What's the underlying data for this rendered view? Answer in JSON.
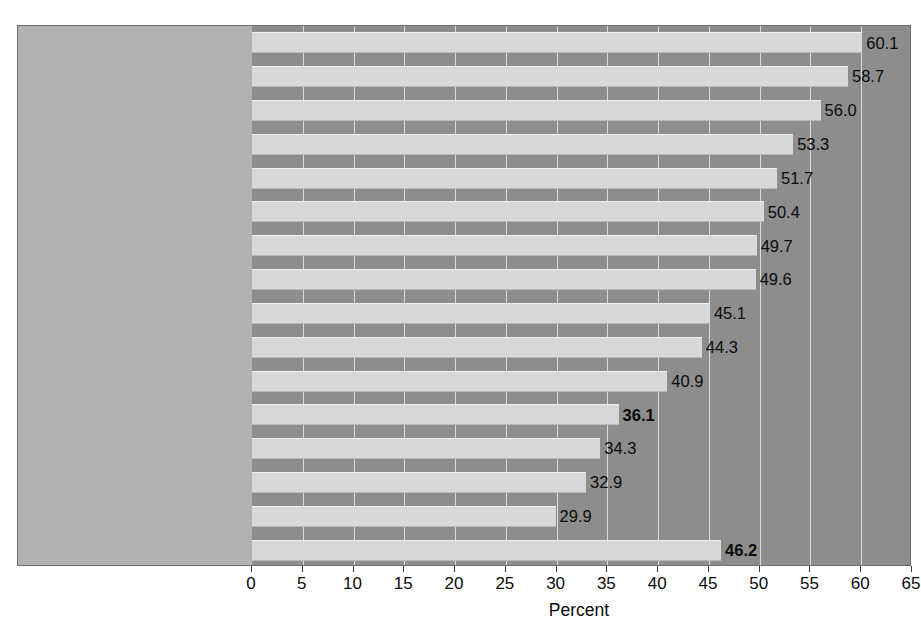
{
  "chart_data": {
    "type": "bar",
    "orientation": "horizontal",
    "title": "",
    "subtitle": "",
    "xlabel": "Percent",
    "ylabel": "",
    "xlim": [
      0,
      65
    ],
    "xticks": [
      0,
      5,
      10,
      15,
      20,
      25,
      30,
      35,
      40,
      45,
      50,
      55,
      60,
      65
    ],
    "xtick_labels": [
      "0",
      "5",
      "10",
      "15",
      "20",
      "25",
      "30",
      "35",
      "40",
      "45",
      "50",
      "55",
      "60",
      "65"
    ],
    "grid": true,
    "grid_axis": "x",
    "legend": null,
    "categories": [
      "Sweden",
      "Denmark",
      "Netherlands",
      "Norway",
      "Italy",
      "Belgium",
      "France",
      "Austria",
      "Germany",
      "Canada",
      "Great Britain",
      "United States",
      "Australia",
      "Japan",
      "Switzerland",
      "Average for all nations"
    ],
    "values": [
      60.1,
      58.7,
      56.0,
      53.3,
      51.7,
      50.4,
      49.7,
      49.6,
      45.1,
      44.3,
      40.9,
      36.1,
      34.3,
      32.9,
      29.9,
      46.2
    ],
    "value_labels": [
      "60.1",
      "58.7",
      "56.0",
      "53.3",
      "51.7",
      "50.4",
      "49.7",
      "49.6",
      "45.1",
      "44.3",
      "40.9",
      "36.1",
      "34.3",
      "32.9",
      "29.9",
      "46.2"
    ],
    "emphasized": [
      "United States",
      "Average for all nations"
    ],
    "bar_color": "#d8d8d8",
    "plot_background": "#8d8d8d",
    "label_panel_background": "#b2b2b2",
    "gridline_color": "#e8e8e8",
    "text_color": "#0b0b0b"
  }
}
